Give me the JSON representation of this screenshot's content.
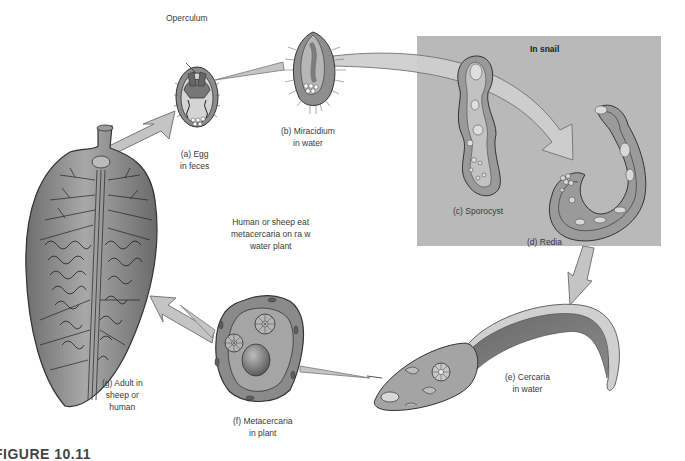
{
  "figure": {
    "caption": "FIGURE 10.11",
    "region_label": "In snail",
    "colors": {
      "background": "#ffffff",
      "snail_region": "#b9b9b9",
      "arrow_fill": "#c4c4c4",
      "arrow_stroke": "#777777",
      "organism_dark": "#7a7a7a",
      "organism_mid": "#9c9c9c",
      "organism_light": "#d6d6d6",
      "outline": "#333333"
    }
  },
  "stages": [
    {
      "id": "a",
      "label": "(a) Egg",
      "sublabel": "in feces",
      "annotation": "Operculum"
    },
    {
      "id": "b",
      "label": "(b) Miracidium",
      "sublabel": "in water"
    },
    {
      "id": "c",
      "label": "(c) Sporocyst",
      "sublabel": ""
    },
    {
      "id": "d",
      "label": "(d) Redia",
      "sublabel": ""
    },
    {
      "id": "e",
      "label": "(e) Cercaria",
      "sublabel": "in water"
    },
    {
      "id": "f",
      "label": "(f) Metacercaria",
      "sublabel": "in plant"
    },
    {
      "id": "g",
      "label": "(g) Adult in",
      "sublabel": "sheep or",
      "sublabel2": "human"
    }
  ],
  "transitions": [
    {
      "from": "g",
      "to": "a"
    },
    {
      "from": "a",
      "to": "b"
    },
    {
      "from": "b",
      "to": "c"
    },
    {
      "from": "c",
      "to": "d"
    },
    {
      "from": "d",
      "to": "e"
    },
    {
      "from": "e",
      "to": "f"
    },
    {
      "from": "f",
      "to": "g"
    }
  ],
  "note": {
    "line1": "Human or sheep eat",
    "line2": "metacercaria on ra w",
    "line3": "water plant"
  }
}
